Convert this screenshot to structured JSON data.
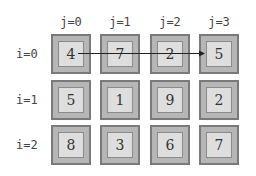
{
  "columns": [
    "j=0",
    "j=1",
    "j=2",
    "j=3"
  ],
  "rows": [
    "i=0",
    "i=1",
    "i=2"
  ],
  "matrix": [
    [
      "4",
      "7",
      "2",
      "5"
    ],
    [
      "5",
      "1",
      "9",
      "2"
    ],
    [
      "8",
      "3",
      "6",
      "7"
    ]
  ],
  "arrow": {
    "from": "i=0,j=0",
    "to": "i=0,j=3"
  },
  "colors": {
    "background": "#ffffff",
    "outer_fill": "#b6b6b6",
    "outer_border": "#7a7a7a",
    "inner_fill": "#dedede",
    "inner_border": "#8a8a8a",
    "arrow": "#222222"
  }
}
